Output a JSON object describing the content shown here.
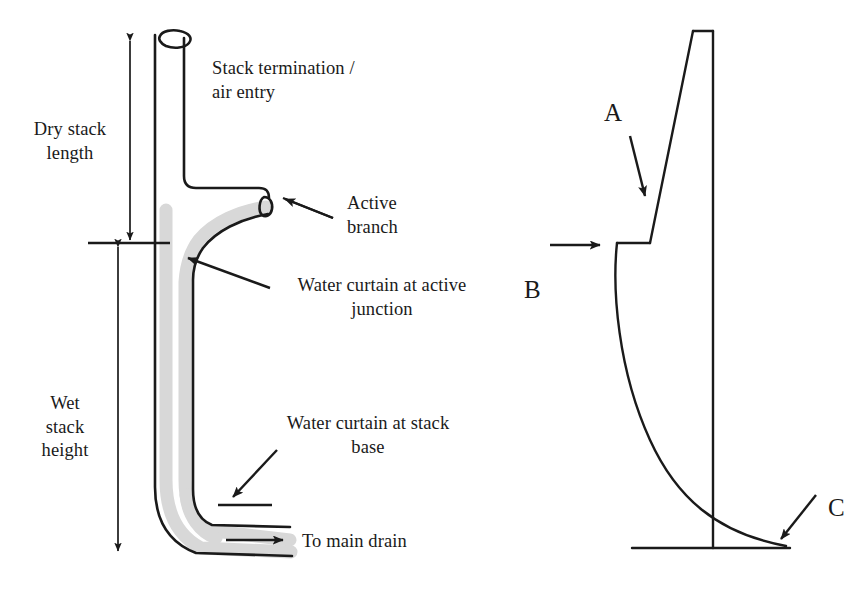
{
  "figure": {
    "type": "diagram",
    "background_color": "#ffffff",
    "line_color": "#1a1a1a",
    "water_curtain_color": "#d6d6d6",
    "width": 866,
    "height": 604
  },
  "left_diagram": {
    "name": "drainage-stack-schematic",
    "dimension_labels": [
      {
        "id": "dry-stack-length",
        "text": "Dry stack\nlength",
        "line1": "Dry stack",
        "line2": "length"
      },
      {
        "id": "wet-stack-height",
        "text": "Wet\nstack\nheight",
        "line1": "Wet",
        "line2": "stack",
        "line3": "height"
      }
    ],
    "callouts": [
      {
        "id": "stack-termination",
        "line1": "Stack termination /",
        "line2": "air entry",
        "align": "left",
        "has_leader": false
      },
      {
        "id": "active-branch",
        "line1": "Active",
        "line2": "branch",
        "align": "left",
        "has_leader": true
      },
      {
        "id": "water-curtain-active-junction",
        "line1": "Water curtain at active",
        "line2": "junction",
        "align": "center",
        "has_leader": true
      },
      {
        "id": "water-curtain-stack-base",
        "line1": "Water curtain at stack",
        "line2": "base",
        "align": "center",
        "has_leader": true
      },
      {
        "id": "to-main-drain",
        "line1": "To main drain",
        "line2": "",
        "align": "left",
        "has_leader": true
      }
    ]
  },
  "right_diagram": {
    "name": "pressure-profile-schematic",
    "markers": [
      {
        "id": "marker-a",
        "label": "A",
        "arrow": "down-right"
      },
      {
        "id": "marker-b",
        "label": "B",
        "arrow": "right"
      },
      {
        "id": "marker-c",
        "label": "C",
        "arrow": "down-left"
      }
    ]
  }
}
